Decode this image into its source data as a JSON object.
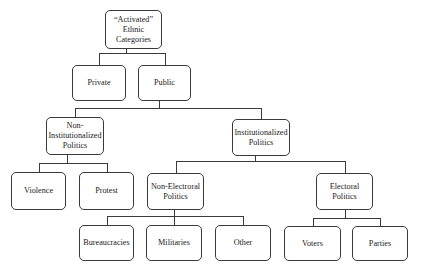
{
  "diagram": {
    "type": "hierarchy",
    "nodes": [
      {
        "id": "root",
        "label": "“Activated”\nEthnic\nCategories"
      },
      {
        "id": "private",
        "label": "Private",
        "parent": "root"
      },
      {
        "id": "public",
        "label": "Public",
        "parent": "root"
      },
      {
        "id": "noninst",
        "label": "Non-\nInstitutionalized\nPolitics",
        "parent": "public"
      },
      {
        "id": "inst",
        "label": "Institutionalized\nPolitics",
        "parent": "public"
      },
      {
        "id": "violence",
        "label": "Violence",
        "parent": "noninst"
      },
      {
        "id": "protest",
        "label": "Protest",
        "parent": "noninst"
      },
      {
        "id": "nonelect",
        "label": "Non-Electroral\nPolitics",
        "parent": "inst"
      },
      {
        "id": "elect",
        "label": "Electoral\nPolitics",
        "parent": "inst"
      },
      {
        "id": "bureau",
        "label": "Bureaucracies",
        "parent": "nonelect"
      },
      {
        "id": "military",
        "label": "Militaries",
        "parent": "nonelect"
      },
      {
        "id": "other",
        "label": "Other",
        "parent": "nonelect"
      },
      {
        "id": "voters",
        "label": "Voters",
        "parent": "elect"
      },
      {
        "id": "parties",
        "label": "Parties",
        "parent": "elect"
      }
    ]
  }
}
